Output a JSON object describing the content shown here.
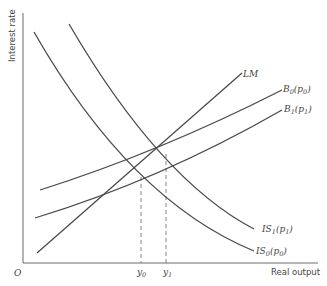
{
  "diagram": {
    "type": "IS-LM-BP diagram",
    "axes": {
      "y_label": "Interest rate",
      "x_label": "Real output",
      "origin_label": "O"
    },
    "curves": {
      "lm": {
        "label": "LM"
      },
      "b0": {
        "label": "B",
        "sub": "0",
        "arg": "(p",
        "arg_sub": "0",
        "arg_close": ")"
      },
      "b1": {
        "label": "B",
        "sub": "1",
        "arg": "(p",
        "arg_sub": "1",
        "arg_close": ")"
      },
      "is1": {
        "label": "IS",
        "sub": "1",
        "arg": "(p",
        "arg_sub": "1",
        "arg_close": ")"
      },
      "is0": {
        "label": "IS",
        "sub": "0",
        "arg": "(p",
        "arg_sub": "0",
        "arg_close": ")"
      }
    },
    "x_ticks": [
      {
        "label": "y",
        "sub": "0"
      },
      {
        "label": "y",
        "sub": "1"
      }
    ]
  }
}
